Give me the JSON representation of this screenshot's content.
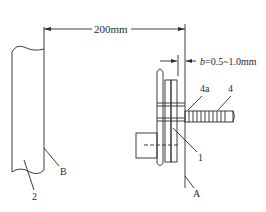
{
  "diagram": {
    "type": "technical mechanical drawing",
    "dimensions": {
      "main_distance": "200mm",
      "gap_prefix": "b",
      "gap_value": "=0.5~1.0mm"
    },
    "labels": {
      "part_1": "1",
      "part_2": "2",
      "part_4": "4",
      "part_4a": "4a",
      "plane_a": "A",
      "plane_b": "B"
    },
    "colors": {
      "line": "#2a2a2a",
      "background": "#ffffff"
    }
  }
}
